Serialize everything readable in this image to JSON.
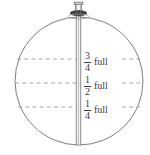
{
  "figure": {
    "type": "technical-line-drawing",
    "stroke_color": "#6e6e6e",
    "text_color": "#3a3a3a",
    "background_color": "#ffffff",
    "tank": {
      "shape": "circle",
      "center_x": 79,
      "center_y": 81,
      "radius": 64
    },
    "standpipe": {
      "name": "center-standpipe",
      "left_x": 76,
      "right_x": 81,
      "top_y": 14,
      "bottom_y": 145
    },
    "valve_cap": {
      "name": "top-valve-cap",
      "center_x": 78.5,
      "top_y": 2
    },
    "fill_levels": [
      {
        "id": "three-quarters",
        "numerator": "3",
        "denominator": "4",
        "unit_label": "full",
        "value": 0.75,
        "y": 59
      },
      {
        "id": "one-half",
        "numerator": "1",
        "denominator": "2",
        "unit_label": "full",
        "value": 0.5,
        "y": 83
      },
      {
        "id": "one-quarter",
        "numerator": "1",
        "denominator": "4",
        "unit_label": "full",
        "value": 0.25,
        "y": 107
      }
    ]
  }
}
